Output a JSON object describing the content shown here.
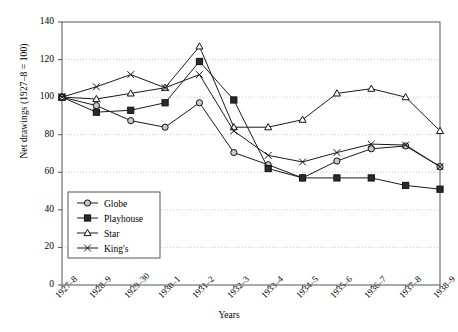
{
  "chart_data": {
    "type": "line",
    "title": "",
    "xlabel": "Years",
    "ylabel": "Net drawings (1927–8 = 100)",
    "categories": [
      "1927–8",
      "1928–9",
      "1929–30",
      "1930–1",
      "1931–2",
      "1932–3",
      "1933–4",
      "1934–5",
      "1935–6",
      "1936–7",
      "1937–8",
      "1938–9"
    ],
    "ylim": [
      0,
      140
    ],
    "yticks": [
      0,
      20,
      40,
      60,
      80,
      100,
      120,
      140
    ],
    "grid": true,
    "grid_axis": "y",
    "legend_position": "lower-left-inside",
    "series": [
      {
        "name": "Globe",
        "marker": "circle",
        "values": [
          100,
          95.5,
          87.5,
          84,
          97,
          70.5,
          64,
          57,
          66,
          72.5,
          74,
          63
        ]
      },
      {
        "name": "Playhouse",
        "marker": "square",
        "values": [
          100,
          92,
          93,
          97,
          119,
          98.5,
          62,
          57,
          57,
          57,
          53,
          51
        ]
      },
      {
        "name": "Star",
        "marker": "triangle",
        "values": [
          100,
          99,
          102,
          105,
          127,
          84,
          84,
          88,
          102,
          104.5,
          100,
          82
        ]
      },
      {
        "name": "King's",
        "marker": "cross",
        "values": [
          100,
          105.5,
          112,
          105,
          112,
          82,
          69,
          65.5,
          70.5,
          75,
          74.5,
          63
        ]
      }
    ]
  },
  "legend": {
    "items": [
      {
        "label": "Globe"
      },
      {
        "label": "Playhouse"
      },
      {
        "label": "Star"
      },
      {
        "label": "King's"
      }
    ]
  }
}
